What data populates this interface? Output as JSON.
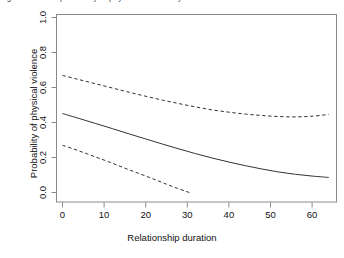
{
  "figure": {
    "clipped_top_caption": "Fig. 1  Predicted probability of physical violence by relationship duration",
    "background_color": "#ffffff",
    "box_color": "#8a8a8a",
    "curve_color": "#333333"
  },
  "chart_data": {
    "type": "line",
    "title": "",
    "xlabel": "Relationship duration",
    "ylabel": "Probability of physical violence",
    "xlim": [
      -1.5,
      66
    ],
    "ylim": [
      0.0,
      1.0
    ],
    "xticks": [
      0,
      10,
      20,
      30,
      40,
      50,
      60
    ],
    "xticklabels": [
      "0",
      "10",
      "20",
      "30",
      "40",
      "50",
      "60"
    ],
    "yticks": [
      0.0,
      0.2,
      0.4,
      0.6,
      0.8,
      1.0
    ],
    "yticklabels": [
      "0.0",
      "0.2",
      "0.4",
      "0.6",
      "0.8",
      "1.0"
    ],
    "grid": false,
    "legend": null,
    "series": [
      {
        "name": "Upper confidence bound",
        "style": "dashed",
        "x": [
          0,
          4,
          8,
          12,
          16,
          20,
          24,
          28,
          32,
          36,
          40,
          44,
          48,
          52,
          56,
          60,
          64
        ],
        "values": [
          0.669,
          0.645,
          0.621,
          0.597,
          0.573,
          0.55,
          0.528,
          0.508,
          0.489,
          0.472,
          0.459,
          0.448,
          0.44,
          0.434,
          0.432,
          0.436,
          0.446
        ]
      },
      {
        "name": "Predicted probability",
        "style": "solid",
        "x": [
          0,
          4,
          8,
          12,
          16,
          20,
          24,
          28,
          32,
          36,
          40,
          44,
          48,
          52,
          56,
          60,
          64
        ],
        "values": [
          0.451,
          0.423,
          0.394,
          0.365,
          0.335,
          0.306,
          0.277,
          0.249,
          0.222,
          0.197,
          0.174,
          0.153,
          0.134,
          0.117,
          0.104,
          0.094,
          0.086
        ]
      },
      {
        "name": "Lower confidence bound",
        "style": "dashed",
        "x": [
          0,
          3,
          6,
          9,
          12,
          15,
          18,
          21,
          24,
          27,
          30.5
        ],
        "values": [
          0.27,
          0.246,
          0.22,
          0.194,
          0.167,
          0.139,
          0.112,
          0.085,
          0.057,
          0.029,
          0.0
        ]
      }
    ]
  }
}
